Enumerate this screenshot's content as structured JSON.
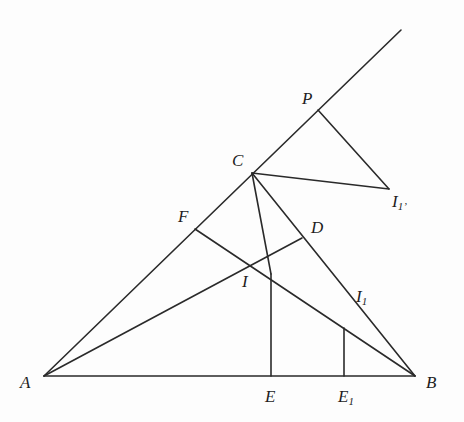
{
  "diagram": {
    "title": "",
    "colors": {
      "line": "#2a2a2a",
      "background": "#fdfdfd",
      "label": "#1e1e1e"
    },
    "points": {
      "A": {
        "label": "A",
        "sub": "",
        "x": 44,
        "y": 376,
        "lx": 20,
        "ly": 374
      },
      "B": {
        "label": "B",
        "sub": "",
        "x": 415,
        "y": 376,
        "lx": 426,
        "ly": 374
      },
      "C": {
        "label": "C",
        "sub": "",
        "x": 252,
        "y": 173,
        "lx": 232,
        "ly": 152
      },
      "P": {
        "label": "P",
        "sub": "",
        "x": 318,
        "y": 110,
        "lx": 302,
        "ly": 90
      },
      "T": {
        "label": "",
        "sub": "",
        "x": 401,
        "y": 30
      },
      "I1p": {
        "label": "I",
        "sub": "1’",
        "x": 389,
        "y": 189,
        "lx": 392,
        "ly": 193
      },
      "F": {
        "label": "F",
        "sub": "",
        "x": 195,
        "y": 229,
        "lx": 178,
        "ly": 208
      },
      "D": {
        "label": "D",
        "sub": "",
        "x": 302,
        "y": 238,
        "lx": 311,
        "ly": 219
      },
      "I": {
        "label": "I",
        "sub": "",
        "x": 250,
        "y": 262,
        "lx": 242,
        "ly": 273
      },
      "I1": {
        "label": "I",
        "sub": "1",
        "x": 355,
        "y": 292,
        "lx": 356,
        "ly": 288
      },
      "E": {
        "label": "E",
        "sub": "",
        "x": 271,
        "y": 376,
        "lx": 265,
        "ly": 388
      },
      "E1": {
        "label": "E",
        "sub": "1",
        "x": 344,
        "y": 376,
        "lx": 338,
        "ly": 388
      }
    },
    "segments": [
      {
        "name": "side-ab",
        "from": "A",
        "to": "B"
      },
      {
        "name": "line-a-top",
        "from": "A",
        "to": "T"
      },
      {
        "name": "side-cb",
        "from": "C",
        "to": "B"
      },
      {
        "name": "bisector-ad",
        "from": "A",
        "to": "D"
      },
      {
        "name": "bisector-bf",
        "from": "B",
        "to": "F"
      },
      {
        "name": "cevian-c-e",
        "from": "C",
        "to": "Eh"
      },
      {
        "name": "perp-ie",
        "from": "Eh",
        "to": "E"
      },
      {
        "name": "perp-e1",
        "from": "E1",
        "to": "E1h"
      },
      {
        "name": "segment-p-i1p",
        "from": "P",
        "to": "I1p"
      },
      {
        "name": "segment-c-i1p",
        "from": "C",
        "to": "I1p"
      }
    ],
    "aux_points": {
      "Eh": {
        "x": 271,
        "y": 274
      },
      "E1h": {
        "x": 344,
        "y": 328
      }
    },
    "labels": [
      "A",
      "B",
      "C",
      "P",
      "I1’",
      "F",
      "D",
      "I",
      "I1",
      "E",
      "E1"
    ]
  }
}
